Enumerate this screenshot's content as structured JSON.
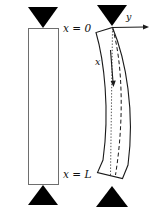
{
  "figure": {
    "type": "engineering-diagram",
    "width": 154,
    "height": 211,
    "background_color": "#ffffff",
    "line_color": "#1a1a1a",
    "support_fill_color": "#000000",
    "labels": {
      "x_zero": "x = 0",
      "x_length": "x = L",
      "axis_y": "y",
      "axis_x": "x"
    },
    "undeformed_column": {
      "name": "straight column",
      "outline_color": "#6e6e6e",
      "fill_color": "#ffffff",
      "left": 28,
      "top": 28,
      "right": 59,
      "bottom": 185
    },
    "buckled_column": {
      "name": "deflected column",
      "outline_color": "#1a1a1a",
      "fill_color": "#ffffff",
      "centerline_style": "dashed",
      "reference_axis_style": "dotted"
    },
    "supports": [
      {
        "name": "top-support-straight",
        "shape": "triangle-down",
        "apex_x": 43,
        "apex_y": 28
      },
      {
        "name": "bottom-support-straight",
        "shape": "triangle-up",
        "apex_x": 43,
        "apex_y": 185
      },
      {
        "name": "top-support-buckled",
        "shape": "triangle-down",
        "apex_x": 112,
        "apex_y": 26
      },
      {
        "name": "bottom-support-buckled",
        "shape": "triangle-up",
        "apex_x": 112,
        "apex_y": 186
      }
    ],
    "axes": [
      {
        "name": "y-axis",
        "direction": "right",
        "from_x": 112,
        "from_y": 27,
        "to_x": 148,
        "to_y": 27
      },
      {
        "name": "x-axis",
        "direction": "down",
        "from_x": 111,
        "from_y": 52,
        "to_x": 114,
        "to_y": 86
      }
    ]
  }
}
